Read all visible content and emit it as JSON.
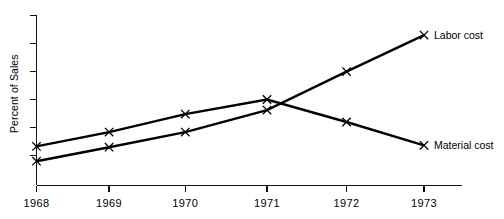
{
  "chart_data": {
    "type": "line",
    "title": "",
    "xlabel": "",
    "ylabel": "Percent of Sales",
    "categories": [
      "1968",
      "1969",
      "1970",
      "1971",
      "1972",
      "1973"
    ],
    "x": [
      1968,
      1969,
      1970,
      1971,
      1972,
      1973
    ],
    "grid": false,
    "legend_position": "right-inline-end-of-line",
    "xlim": [
      1968,
      1973
    ],
    "ylim": [
      0,
      6
    ],
    "y_axis": {
      "tick_count": 6,
      "tick_labels": [
        "",
        "",
        "",
        "",
        "",
        ""
      ],
      "labels_shown": false
    },
    "series": [
      {
        "name": "Labor cost",
        "marker": "x",
        "label_at_end": "Labor cost",
        "values": [
          0.52,
          1.05,
          1.62,
          2.45,
          3.9,
          5.28
        ]
      },
      {
        "name": "Material cost",
        "marker": "x",
        "label_at_end": "Material cost",
        "values": [
          1.08,
          1.62,
          2.3,
          2.85,
          2.0,
          1.12
        ]
      }
    ],
    "annotations": [
      "Labor cost rises steadily across the period",
      "Material cost peaks in 1971 then declines",
      "The two series cross between 1971 and 1972"
    ]
  },
  "axis": {
    "y_title": "Percent of Sales"
  },
  "series_labels": {
    "labor": "Labor cost",
    "material": "Material cost"
  },
  "x_tick_labels": {
    "t0": "1968",
    "t1": "1969",
    "t2": "1970",
    "t3": "1971",
    "t4": "1972",
    "t5": "1973"
  },
  "colors": {
    "ink": "#000000",
    "background": "#ffffff"
  }
}
